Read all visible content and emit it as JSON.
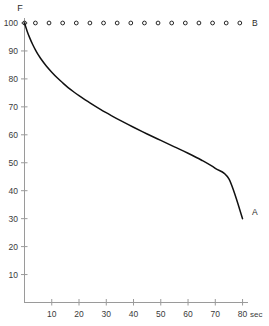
{
  "chart_data": {
    "type": "line",
    "title": "",
    "subtitle": "",
    "xlabel": "sec",
    "ylabel": "F",
    "xlim": [
      0,
      82
    ],
    "ylim": [
      0,
      103
    ],
    "grid": false,
    "legend_position": "inline-right",
    "x_ticks": [
      10,
      20,
      30,
      40,
      50,
      60,
      70,
      80
    ],
    "x_tick_labels": [
      "10",
      "20",
      "30",
      "40",
      "50",
      "60",
      "70",
      "80"
    ],
    "y_ticks": [
      10,
      20,
      30,
      40,
      50,
      60,
      70,
      80,
      90,
      100
    ],
    "y_tick_labels": [
      "10",
      "20",
      "30",
      "40",
      "50",
      "60",
      "70",
      "80",
      "90",
      "100"
    ],
    "x_unit_suffix": "sec",
    "series": [
      {
        "name": "A",
        "label": "A",
        "style": "solid-curve",
        "color": "#111111",
        "x": [
          0,
          1,
          2,
          3,
          4,
          5,
          6,
          8,
          10,
          12,
          14,
          16,
          18,
          20,
          24,
          28,
          32,
          36,
          40,
          45,
          50,
          55,
          60,
          65,
          70,
          75,
          80
        ],
        "values": [
          100,
          97,
          94.5,
          92.3,
          90.4,
          88.7,
          87.2,
          84.6,
          82.4,
          80.4,
          78.6,
          76.9,
          75.4,
          74.0,
          71.4,
          69.0,
          66.8,
          64.7,
          62.7,
          60.3,
          58.0,
          55.7,
          53.4,
          50.9,
          48.0,
          44.2,
          30.0
        ]
      },
      {
        "name": "B",
        "label": "B",
        "style": "open-circle-markers",
        "color": "#111111",
        "x": [
          0,
          4,
          9,
          14,
          19,
          24,
          29,
          34,
          39,
          44,
          49,
          54,
          59,
          64,
          69,
          74,
          79
        ],
        "values": [
          100,
          100,
          100,
          100,
          100,
          100,
          100,
          100,
          100,
          100,
          100,
          100,
          100,
          100,
          100,
          100,
          100
        ]
      }
    ],
    "annotations": [
      {
        "text": "A",
        "x": 82,
        "y": 31
      },
      {
        "text": "B",
        "x": 82,
        "y": 100
      }
    ]
  },
  "axis": {
    "y_axis_title": "F",
    "x_unit": "sec"
  }
}
